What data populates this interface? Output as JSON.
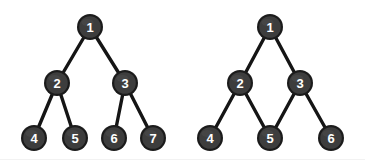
{
  "figure": {
    "background_color": "#ffffff",
    "width": 365,
    "height": 163,
    "node_fill_color": "#3d3d3d",
    "node_rim_color": "#1b1b1b",
    "node_label_color": "#ffffff",
    "edge_color": "#151515",
    "node_radius": 13
  },
  "graphs": [
    {
      "id": "left-graph",
      "name": "binary-tree",
      "type": "tree",
      "node_count": 7,
      "edge_count": 6,
      "depth": 3,
      "nodes": [
        {
          "id": "1",
          "label": "1",
          "x": 90,
          "y": 27,
          "level": 0
        },
        {
          "id": "2",
          "label": "2",
          "x": 57,
          "y": 83,
          "level": 1
        },
        {
          "id": "3",
          "label": "3",
          "x": 125,
          "y": 83,
          "level": 1
        },
        {
          "id": "4",
          "label": "4",
          "x": 34,
          "y": 138,
          "level": 2
        },
        {
          "id": "5",
          "label": "5",
          "x": 75,
          "y": 138,
          "level": 2
        },
        {
          "id": "6",
          "label": "6",
          "x": 114,
          "y": 138,
          "level": 2
        },
        {
          "id": "7",
          "label": "7",
          "x": 153,
          "y": 138,
          "level": 2
        }
      ],
      "edges": [
        {
          "from": "1",
          "to": "2"
        },
        {
          "from": "1",
          "to": "3"
        },
        {
          "from": "2",
          "to": "4"
        },
        {
          "from": "2",
          "to": "5"
        },
        {
          "from": "3",
          "to": "6"
        },
        {
          "from": "3",
          "to": "7"
        }
      ]
    },
    {
      "id": "right-graph",
      "name": "directed-acyclic-graph",
      "type": "dag",
      "node_count": 6,
      "edge_count": 6,
      "depth": 3,
      "shared_node": "5",
      "nodes": [
        {
          "id": "1",
          "label": "1",
          "x": 270,
          "y": 27,
          "level": 0
        },
        {
          "id": "2",
          "label": "2",
          "x": 240,
          "y": 83,
          "level": 1
        },
        {
          "id": "3",
          "label": "3",
          "x": 300,
          "y": 83,
          "level": 1
        },
        {
          "id": "4",
          "label": "4",
          "x": 210,
          "y": 138,
          "level": 2
        },
        {
          "id": "5",
          "label": "5",
          "x": 270,
          "y": 138,
          "level": 2
        },
        {
          "id": "6",
          "label": "6",
          "x": 331,
          "y": 138,
          "level": 2
        }
      ],
      "edges": [
        {
          "from": "1",
          "to": "2"
        },
        {
          "from": "1",
          "to": "3"
        },
        {
          "from": "2",
          "to": "4"
        },
        {
          "from": "2",
          "to": "5"
        },
        {
          "from": "3",
          "to": "5"
        },
        {
          "from": "3",
          "to": "6"
        }
      ]
    }
  ]
}
